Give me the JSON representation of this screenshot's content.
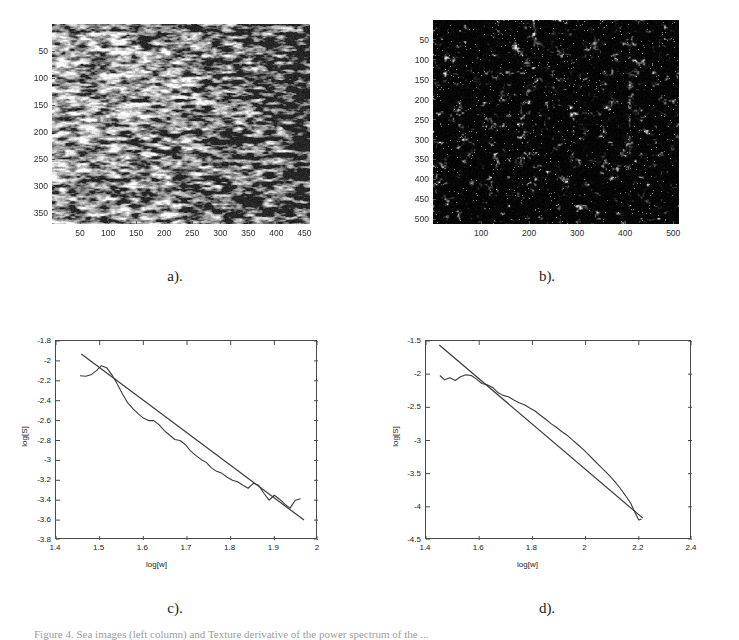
{
  "figure": {
    "background": "#ffffff",
    "caption": "Figure 4. Sea images (left column) and Texture derivative of the power spectrum of the ..."
  },
  "panels": [
    {
      "id": "a",
      "letter": "a).",
      "type": "grayscale-image",
      "description": "sea surface texture image, light speckled horizontal streaks",
      "axes": {
        "xticks": [
          50,
          100,
          150,
          200,
          250,
          300,
          350,
          400,
          450
        ],
        "yticks": [
          50,
          100,
          150,
          200,
          250,
          300,
          350
        ],
        "xrange": [
          0,
          460
        ],
        "yrange": [
          0,
          370
        ]
      }
    },
    {
      "id": "b",
      "letter": "b).",
      "type": "grayscale-image",
      "description": "dark sea surface texture image with bright speckles",
      "axes": {
        "xticks": [
          100,
          200,
          300,
          400,
          500
        ],
        "yticks": [
          50,
          100,
          150,
          200,
          250,
          300,
          350,
          400,
          450,
          500
        ],
        "xrange": [
          0,
          512
        ],
        "yrange": [
          0,
          512
        ]
      }
    },
    {
      "id": "c",
      "letter": "c).",
      "type": "plot"
    },
    {
      "id": "d",
      "letter": "d).",
      "type": "plot"
    }
  ],
  "chart_data": [
    {
      "panel": "c",
      "type": "line",
      "title": "",
      "xlabel": "log[w]",
      "ylabel": "log[S]",
      "xlim": [
        1.4,
        2.0
      ],
      "ylim": [
        -3.8,
        -1.8
      ],
      "xticks": [
        1.4,
        1.5,
        1.6,
        1.7,
        1.8,
        1.9,
        2
      ],
      "yticks": [
        -1.8,
        -2,
        -2.2,
        -2.4,
        -2.6,
        -2.8,
        -3,
        -3.2,
        -3.4,
        -3.6,
        -3.8
      ],
      "grid": false,
      "legend": "none",
      "series": [
        {
          "name": "log spectrum",
          "x": [
            1.455,
            1.468,
            1.48,
            1.492,
            1.504,
            1.516,
            1.528,
            1.54,
            1.552,
            1.564,
            1.576,
            1.588,
            1.6,
            1.612,
            1.624,
            1.636,
            1.648,
            1.66,
            1.672,
            1.684,
            1.696,
            1.708,
            1.72,
            1.732,
            1.744,
            1.756,
            1.768,
            1.78,
            1.792,
            1.804,
            1.816,
            1.828,
            1.84,
            1.852,
            1.864,
            1.876,
            1.888,
            1.9,
            1.912,
            1.924,
            1.936,
            1.948,
            1.96
          ],
          "y": [
            -2.15,
            -2.155,
            -2.14,
            -2.1,
            -2.048,
            -2.068,
            -2.14,
            -2.23,
            -2.33,
            -2.42,
            -2.48,
            -2.53,
            -2.575,
            -2.6,
            -2.6,
            -2.64,
            -2.7,
            -2.745,
            -2.79,
            -2.8,
            -2.84,
            -2.905,
            -2.95,
            -2.99,
            -3.02,
            -3.075,
            -3.11,
            -3.13,
            -3.17,
            -3.2,
            -3.215,
            -3.25,
            -3.28,
            -3.23,
            -3.25,
            -3.33,
            -3.4,
            -3.35,
            -3.39,
            -3.44,
            -3.48,
            -3.4,
            -3.385
          ]
        },
        {
          "name": "linear fit",
          "x": [
            1.458,
            1.968
          ],
          "y": [
            -1.93,
            -3.6
          ],
          "slope": -3.27
        }
      ]
    },
    {
      "panel": "d",
      "type": "line",
      "title": "",
      "xlabel": "log[w]",
      "ylabel": "log[S]",
      "xlim": [
        1.4,
        2.4
      ],
      "ylim": [
        -4.5,
        -1.5
      ],
      "xticks": [
        1.4,
        1.6,
        1.8,
        2,
        2.2,
        2.4
      ],
      "yticks": [
        -1.5,
        -2,
        -2.5,
        -3,
        -3.5,
        -4,
        -4.5
      ],
      "grid": false,
      "legend": "none",
      "series": [
        {
          "name": "log spectrum",
          "x": [
            1.452,
            1.47,
            1.49,
            1.51,
            1.53,
            1.55,
            1.57,
            1.59,
            1.61,
            1.63,
            1.65,
            1.67,
            1.69,
            1.71,
            1.73,
            1.75,
            1.77,
            1.79,
            1.81,
            1.83,
            1.85,
            1.87,
            1.89,
            1.91,
            1.93,
            1.95,
            1.97,
            1.99,
            2.01,
            2.03,
            2.05,
            2.07,
            2.09,
            2.11,
            2.13,
            2.15,
            2.17,
            2.185,
            2.2,
            2.21
          ],
          "y": [
            -2.02,
            -2.085,
            -2.055,
            -2.095,
            -2.04,
            -2.01,
            -2.02,
            -2.075,
            -2.14,
            -2.16,
            -2.2,
            -2.275,
            -2.32,
            -2.34,
            -2.39,
            -2.43,
            -2.46,
            -2.51,
            -2.555,
            -2.62,
            -2.68,
            -2.745,
            -2.8,
            -2.865,
            -2.92,
            -2.99,
            -3.06,
            -3.13,
            -3.21,
            -3.29,
            -3.37,
            -3.45,
            -3.53,
            -3.62,
            -3.72,
            -3.83,
            -3.95,
            -4.08,
            -4.2,
            -4.185
          ]
        },
        {
          "name": "linear fit",
          "x": [
            1.45,
            2.215
          ],
          "y": [
            -1.56,
            -4.17
          ],
          "slope": -3.41
        }
      ]
    }
  ]
}
